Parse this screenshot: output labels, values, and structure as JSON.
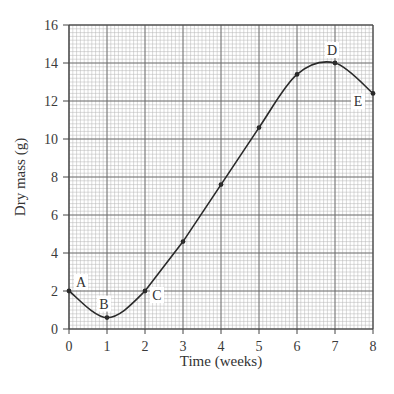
{
  "chart_data": {
    "type": "line",
    "title": "",
    "xlabel": "Time (weeks)",
    "ylabel": "Dry mass (g)",
    "xlim": [
      0,
      8
    ],
    "ylim": [
      0,
      16
    ],
    "x_ticks": [
      "0",
      "1",
      "2",
      "3",
      "4",
      "5",
      "6",
      "7",
      "8"
    ],
    "y_ticks": [
      "0",
      "2",
      "4",
      "6",
      "8",
      "10",
      "12",
      "14",
      "16"
    ],
    "grid": true,
    "legend": null,
    "series": [
      {
        "name": "Dry mass",
        "x": [
          0,
          1,
          2,
          3,
          4,
          5,
          6,
          7,
          8
        ],
        "values": [
          2.0,
          0.6,
          2.0,
          4.6,
          7.6,
          10.6,
          13.4,
          14.0,
          12.4
        ]
      }
    ],
    "annotations": [
      {
        "label": "A",
        "x": 0,
        "y": 2.0
      },
      {
        "label": "B",
        "x": 1,
        "y": 0.6
      },
      {
        "label": "C",
        "x": 2,
        "y": 2.0
      },
      {
        "label": "D",
        "x": 7,
        "y": 14.0
      },
      {
        "label": "E",
        "x": 8,
        "y": 12.4
      }
    ]
  },
  "style": {
    "line_color": "#2a2a2a",
    "grid_major": "#6a6a6a",
    "grid_minor": "#b5b5b5",
    "label_bg": "#ffffff"
  }
}
